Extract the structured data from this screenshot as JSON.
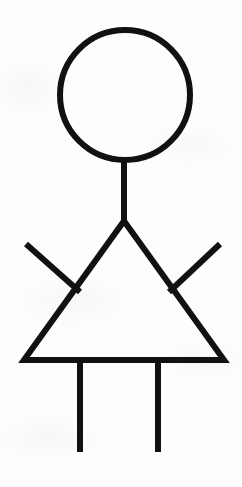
{
  "canvas": {
    "width": 242,
    "height": 487,
    "background_color": "#fdfdfd",
    "ink_color": "#111111",
    "medium": "scanned line drawing"
  },
  "artwork": {
    "title": "Stick Figure",
    "subject": "person",
    "style": "black-ink line drawing on white paper",
    "stroke_width": 6,
    "stroke_linecap": "butt",
    "fill": "none"
  },
  "parts": [
    {
      "name": "head",
      "label": "Head",
      "shape": "circle",
      "cx": 125,
      "cy": 95,
      "r": 65,
      "stroke_width": 6
    },
    {
      "name": "neck",
      "label": "Neck",
      "shape": "line",
      "x1": 124,
      "y1": 160,
      "x2": 124,
      "y2": 223,
      "stroke_width": 6
    },
    {
      "name": "body",
      "label": "Body (triangular dress)",
      "shape": "polygon",
      "points": "124,221 224,360 24,360",
      "stroke_width": 6
    },
    {
      "name": "left-arm",
      "label": "Left arm",
      "shape": "line",
      "x1": 26,
      "y1": 244,
      "x2": 80,
      "y2": 292,
      "stroke_width": 6
    },
    {
      "name": "right-arm",
      "label": "Right arm",
      "shape": "line",
      "x1": 220,
      "y1": 244,
      "x2": 169,
      "y2": 292,
      "stroke_width": 6
    },
    {
      "name": "left-leg",
      "label": "Left leg",
      "shape": "line",
      "x1": 80,
      "y1": 360,
      "x2": 80,
      "y2": 452,
      "stroke_width": 6
    },
    {
      "name": "right-leg",
      "label": "Right leg",
      "shape": "line",
      "x1": 158,
      "y1": 360,
      "x2": 158,
      "y2": 452,
      "stroke_width": 6
    }
  ]
}
